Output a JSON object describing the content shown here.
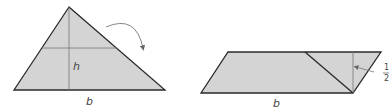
{
  "diagram": {
    "colors": {
      "fill": "#d4d4d4",
      "stroke": "#2a2a2a",
      "guide": "#666666",
      "label": "#444444"
    },
    "triangle": {
      "height_label": "h",
      "base_label": "b"
    },
    "parallelogram": {
      "base_label": "b",
      "height_label_numerator": "1",
      "height_label_denominator": "2",
      "height_label_suffix": "h"
    },
    "rotation_arrow": "curved-arrow"
  }
}
